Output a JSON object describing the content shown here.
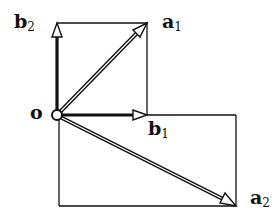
{
  "diagram": {
    "colors": {
      "ink": "#111111",
      "background": "#ffffff"
    },
    "origin": {
      "label": "o",
      "x": 57,
      "y": 115
    },
    "labels": [
      {
        "id": "b2",
        "base": "b",
        "sub": "2",
        "x": 14,
        "y": 12
      },
      {
        "id": "a1",
        "base": "a",
        "sub": "1",
        "x": 162,
        "y": 13
      },
      {
        "id": "b1",
        "base": "b",
        "sub": "1",
        "x": 148,
        "y": 120
      },
      {
        "id": "a2",
        "base": "a",
        "sub": "2",
        "x": 250,
        "y": 190
      },
      {
        "id": "o",
        "base": "o",
        "sub": "",
        "x": 30,
        "y": 106
      }
    ],
    "vectors": [
      {
        "id": "b2",
        "from": [
          57,
          115
        ],
        "to": [
          57,
          23
        ],
        "style": "thick"
      },
      {
        "id": "b1",
        "from": [
          57,
          115
        ],
        "to": [
          147,
          115
        ],
        "style": "thick"
      },
      {
        "id": "a1",
        "from": [
          57,
          115
        ],
        "to": [
          147,
          23
        ],
        "style": "double"
      },
      {
        "id": "a2",
        "from": [
          57,
          115
        ],
        "to": [
          236,
          206
        ],
        "style": "double"
      }
    ],
    "boxes": [
      {
        "id": "upper",
        "x1": 57,
        "y1": 23,
        "x2": 147,
        "y2": 115
      },
      {
        "id": "lower",
        "x1": 59,
        "y1": 115,
        "x2": 236,
        "y2": 206
      }
    ]
  }
}
